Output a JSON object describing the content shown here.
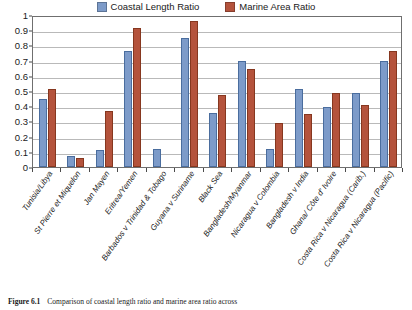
{
  "figure": {
    "caption_number": "Figure 6.1",
    "caption_text": "Comparison of coastal length ratio and marine area ratio across"
  },
  "legend": {
    "position": "top-center",
    "entries": [
      {
        "label": "Coastal Length Ratio",
        "color": "#7d9bc9"
      },
      {
        "label": "Marine Area Ratio",
        "color": "#b4533c"
      }
    ]
  },
  "chart_data": {
    "type": "bar",
    "title": "",
    "xlabel": "",
    "ylabel": "",
    "ylim": [
      0,
      1
    ],
    "grid": true,
    "legend_position": "top-center",
    "ytick_labels": [
      "0",
      "0.1",
      "0.2",
      "0.3",
      "0.4",
      "0.5",
      "0.6",
      "0.7",
      "0.8",
      "0.9",
      "1"
    ],
    "ytick_values": [
      0,
      0.1,
      0.2,
      0.3,
      0.4,
      0.5,
      0.6,
      0.7,
      0.8,
      0.9,
      1
    ],
    "categories": [
      "Tunisia/Libya",
      "St Pierre et Miquelon",
      "Jan Mayen",
      "Eritrea/Yemen",
      "Barbados v Trinidad & Tobago",
      "Guyana v Suriname",
      "Black Sea",
      "Bangladesh/Myanmar",
      "Nicaragua v Colombia",
      "Bangladesh v India",
      "Ghana/ Côte d' Ivoire",
      "Costa Rica v Nicaragua (Carib.)",
      "Costa Rica v Nicaragua (Pacific)"
    ],
    "series": [
      {
        "name": "Coastal Length Ratio",
        "color": "#7d9bc9",
        "values": [
          0.45,
          0.07,
          0.11,
          0.76,
          0.12,
          0.85,
          0.355,
          0.7,
          0.12,
          0.515,
          0.395,
          0.485,
          0.7
        ]
      },
      {
        "name": "Marine Area Ratio",
        "color": "#b4533c",
        "values": [
          0.515,
          0.06,
          0.37,
          0.915,
          null,
          0.96,
          0.475,
          0.645,
          0.29,
          0.35,
          0.49,
          0.41,
          0.76
        ]
      }
    ]
  }
}
